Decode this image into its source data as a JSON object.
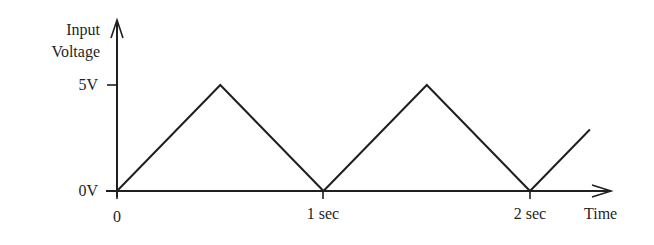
{
  "chart_data": {
    "type": "line",
    "title": "",
    "xlabel": "Time",
    "ylabel": "Input Voltage",
    "ylabel_lines": [
      "Input",
      "Voltage"
    ],
    "x_ticks": [
      {
        "value": 0,
        "label": "0"
      },
      {
        "value": 1,
        "label": "1 sec"
      },
      {
        "value": 2,
        "label": "2 sec"
      }
    ],
    "y_ticks": [
      {
        "value": 0,
        "label": "0V"
      },
      {
        "value": 5,
        "label": "5V"
      }
    ],
    "xlim": [
      0,
      2.3
    ],
    "ylim": [
      0,
      5
    ],
    "grid": false,
    "legend": null,
    "series": [
      {
        "name": "Input Voltage (triangle wave)",
        "x": [
          0,
          0.5,
          1.0,
          1.5,
          2.0,
          2.29
        ],
        "y": [
          0,
          5,
          0,
          5,
          0,
          2.9
        ]
      }
    ],
    "line_color": "#1f1f1f"
  }
}
